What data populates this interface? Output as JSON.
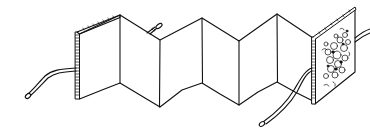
{
  "illustration": {
    "subject": "accordion-fold book with tie ribbons",
    "style": "black ink line drawing on white",
    "colors": {
      "background": "#ffffff",
      "ink": "#111111"
    },
    "panels": 6,
    "covers": [
      "left-cover-plain",
      "right-cover-patterned"
    ],
    "ties": 3
  }
}
